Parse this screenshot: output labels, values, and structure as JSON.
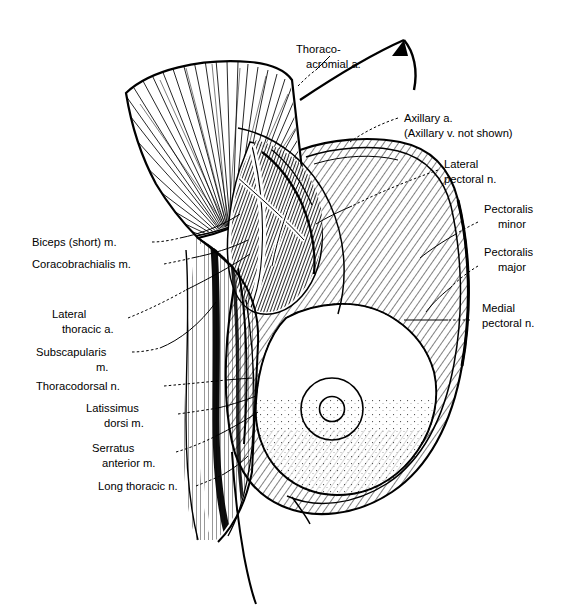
{
  "figure": {
    "style": "black-and-white engraved line drawing",
    "background_color": "#ffffff",
    "ink_color": "#000000"
  },
  "labels": {
    "thoracoacromial_artery": {
      "line1": "Thoraco-",
      "line2": "acromial a."
    },
    "axillary_artery": {
      "line1": "Axillary a.",
      "line2": "(Axillary v. not shown)"
    },
    "lateral_pectoral_nerve": {
      "line1": "Lateral",
      "line2": "pectoral n."
    },
    "pectoralis_minor": {
      "line1": "Pectoralis",
      "line2": "minor"
    },
    "pectoralis_major": {
      "line1": "Pectoralis",
      "line2": "major"
    },
    "medial_pectoral_nerve": {
      "line1": "Medial",
      "line2": "pectoral n."
    },
    "biceps_short_head": {
      "line1": "Biceps (short) m."
    },
    "coracobrachialis": {
      "line1": "Coracobrachialis m."
    },
    "lateral_thoracic_artery": {
      "line1": "Lateral",
      "line2": "thoracic a."
    },
    "subscapularis": {
      "line1": "Subscapularis",
      "line2": "m."
    },
    "thoracodorsal_nerve": {
      "line1": "Thoracodorsal n."
    },
    "latissimus_dorsi": {
      "line1": "Latissimus",
      "line2": "dorsi m."
    },
    "serratus_anterior": {
      "line1": "Serratus",
      "line2": "anterior m."
    },
    "long_thoracic_nerve": {
      "line1": "Long thoracic n."
    }
  },
  "structures": {
    "nipple_areola": "concentric circles marking nipple and areola",
    "breast_mass": "stippled breast tissue",
    "reflection_arrow": "curved arrow showing direction of muscle reflection"
  }
}
